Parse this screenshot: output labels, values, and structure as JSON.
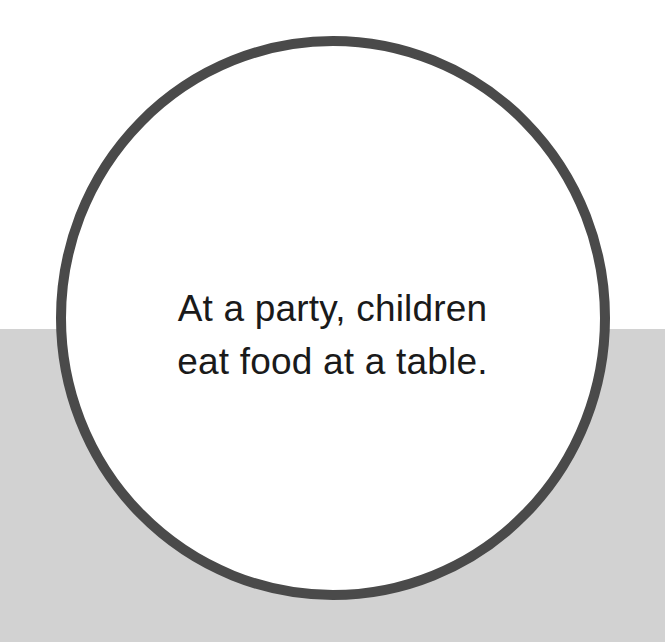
{
  "canvas": {
    "width": 665,
    "height": 642,
    "background_top_color": "#ffffff",
    "background_bottom_color": "#d2d2d2",
    "band_split_y": 329
  },
  "circle": {
    "shape_name": "circle-outline",
    "stroke_color": "#4a4a4a",
    "fill_color": "#ffffff",
    "stroke_width": 10,
    "center_x": 333,
    "center_y": 318,
    "radius_x": 272,
    "radius_y": 277
  },
  "caption": {
    "text_color": "#1a1a1a",
    "font_size_px": 37,
    "line_height_px": 53,
    "align": "center",
    "full_text": "At a party, children eat food at a table.",
    "lines": [
      "At a party, children",
      "eat food at a table."
    ]
  }
}
